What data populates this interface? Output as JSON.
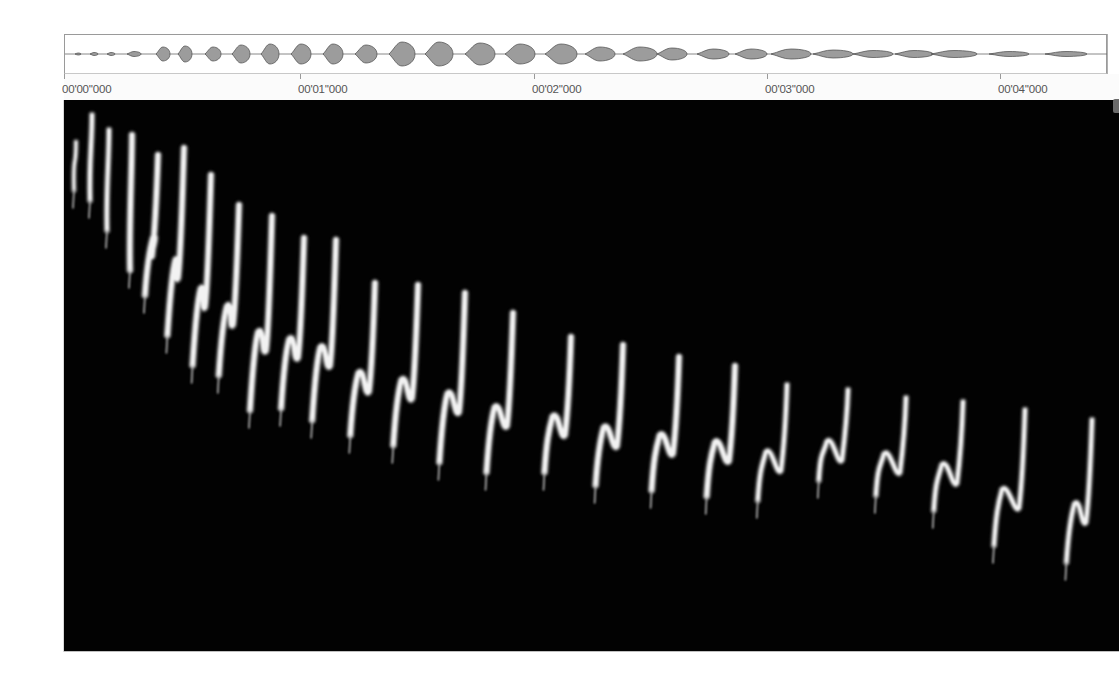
{
  "app": {
    "view": "spectrogram-analysis",
    "colors": {
      "background": "#ffffff",
      "spectrogram_bg": "#020202",
      "call_color": "#f2f2f2",
      "waveform_fill": "#9c9c9c",
      "waveform_stroke": "#4a4a4a",
      "ruler_text": "#555555"
    }
  },
  "ruler": {
    "ticks": [
      {
        "label": "00'00''000",
        "x": 0
      },
      {
        "label": "00'01''000",
        "x": 236
      },
      {
        "label": "00'02''000",
        "x": 470
      },
      {
        "label": "00'03''000",
        "x": 703
      },
      {
        "label": "00'04''000",
        "x": 936
      }
    ]
  },
  "overview": {
    "label": "waveform-overview",
    "blobs": [
      {
        "x": 10,
        "w": 6,
        "h": 2
      },
      {
        "x": 25,
        "w": 8,
        "h": 3
      },
      {
        "x": 42,
        "w": 8,
        "h": 3
      },
      {
        "x": 62,
        "w": 14,
        "h": 5
      },
      {
        "x": 91,
        "w": 14,
        "h": 14
      },
      {
        "x": 113,
        "w": 14,
        "h": 16
      },
      {
        "x": 140,
        "w": 16,
        "h": 14
      },
      {
        "x": 167,
        "w": 18,
        "h": 18
      },
      {
        "x": 196,
        "w": 18,
        "h": 20
      },
      {
        "x": 226,
        "w": 20,
        "h": 20
      },
      {
        "x": 258,
        "w": 20,
        "h": 20
      },
      {
        "x": 290,
        "w": 22,
        "h": 18
      },
      {
        "x": 324,
        "w": 26,
        "h": 24
      },
      {
        "x": 360,
        "w": 28,
        "h": 24
      },
      {
        "x": 400,
        "w": 30,
        "h": 22
      },
      {
        "x": 440,
        "w": 30,
        "h": 20
      },
      {
        "x": 480,
        "w": 32,
        "h": 20
      },
      {
        "x": 520,
        "w": 30,
        "h": 14
      },
      {
        "x": 558,
        "w": 34,
        "h": 14
      },
      {
        "x": 592,
        "w": 30,
        "h": 12
      },
      {
        "x": 632,
        "w": 32,
        "h": 10
      },
      {
        "x": 670,
        "w": 32,
        "h": 10
      },
      {
        "x": 706,
        "w": 40,
        "h": 10
      },
      {
        "x": 748,
        "w": 40,
        "h": 8
      },
      {
        "x": 788,
        "w": 40,
        "h": 7
      },
      {
        "x": 830,
        "w": 38,
        "h": 7
      },
      {
        "x": 866,
        "w": 46,
        "h": 7
      },
      {
        "x": 924,
        "w": 40,
        "h": 5
      },
      {
        "x": 980,
        "w": 42,
        "h": 5
      }
    ]
  },
  "spectrogram": {
    "label": "spectrogram-view",
    "duration_s": 4.5,
    "calls": [
      {
        "x": 10,
        "top": 42,
        "bottom": 90,
        "kink": 0,
        "w": 3
      },
      {
        "x": 26,
        "top": 15,
        "bottom": 100,
        "kink": 0,
        "w": 4
      },
      {
        "x": 43,
        "top": 30,
        "bottom": 130,
        "kink": 0,
        "w": 4
      },
      {
        "x": 66,
        "top": 35,
        "bottom": 170,
        "kink": 0,
        "w": 5
      },
      {
        "x": 90,
        "top": 55,
        "bottom": 195,
        "kink": 20,
        "w": 5
      },
      {
        "x": 116,
        "top": 48,
        "bottom": 235,
        "kink": 28,
        "w": 5
      },
      {
        "x": 143,
        "top": 75,
        "bottom": 265,
        "kink": 32,
        "w": 5
      },
      {
        "x": 171,
        "top": 105,
        "bottom": 275,
        "kink": 36,
        "w": 5
      },
      {
        "x": 204,
        "top": 116,
        "bottom": 310,
        "kink": 40,
        "w": 5
      },
      {
        "x": 236,
        "top": 138,
        "bottom": 308,
        "kink": 42,
        "w": 5
      },
      {
        "x": 268,
        "top": 140,
        "bottom": 320,
        "kink": 44,
        "w": 5
      },
      {
        "x": 307,
        "top": 183,
        "bottom": 335,
        "kink": 46,
        "w": 5
      },
      {
        "x": 350,
        "top": 185,
        "bottom": 345,
        "kink": 46,
        "w": 5
      },
      {
        "x": 397,
        "top": 193,
        "bottom": 362,
        "kink": 48,
        "w": 5
      },
      {
        "x": 445,
        "top": 213,
        "bottom": 372,
        "kink": 50,
        "w": 5
      },
      {
        "x": 503,
        "top": 237,
        "bottom": 372,
        "kink": 50,
        "w": 5
      },
      {
        "x": 555,
        "top": 245,
        "bottom": 385,
        "kink": 52,
        "w": 5
      },
      {
        "x": 611,
        "top": 257,
        "bottom": 390,
        "kink": 52,
        "w": 5
      },
      {
        "x": 667,
        "top": 266,
        "bottom": 396,
        "kink": 54,
        "w": 5
      },
      {
        "x": 719,
        "top": 285,
        "bottom": 400,
        "kink": 56,
        "w": 4
      },
      {
        "x": 780,
        "top": 290,
        "bottom": 380,
        "kink": 56,
        "w": 4
      },
      {
        "x": 838,
        "top": 298,
        "bottom": 395,
        "kink": 58,
        "w": 4
      },
      {
        "x": 895,
        "top": 302,
        "bottom": 410,
        "kink": 56,
        "w": 4
      },
      {
        "x": 957,
        "top": 310,
        "bottom": 445,
        "kink": 60,
        "w": 4
      },
      {
        "x": 1024,
        "top": 320,
        "bottom": 462,
        "kink": 48,
        "w": 4
      }
    ]
  }
}
